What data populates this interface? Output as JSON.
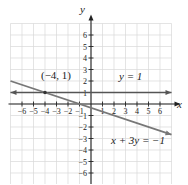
{
  "chart_data": {
    "type": "line",
    "title": "",
    "xlabel": "x",
    "ylabel": "y",
    "xlim": [
      -7,
      7
    ],
    "ylim": [
      -7,
      7
    ],
    "grid": true,
    "x_ticks": [
      "-6",
      "-5",
      "-4",
      "-3",
      "-2",
      "-1",
      "1",
      "2",
      "3",
      "4",
      "5",
      "6"
    ],
    "y_ticks": [
      "6",
      "5",
      "4",
      "3",
      "2",
      "1",
      "-1",
      "-2",
      "-3",
      "-4",
      "-5",
      "-6"
    ],
    "series": [
      {
        "name": "y = 1",
        "equation": "y = 1",
        "x": [
          -7,
          7
        ],
        "y": [
          1,
          1
        ],
        "color": "#555555"
      },
      {
        "name": "x + 3y = -1",
        "equation": "x + 3y = -1",
        "x": [
          -7,
          7
        ],
        "y": [
          2,
          -2.667
        ],
        "color": "#777777"
      }
    ],
    "annotations": [
      {
        "text": "(-4, 1)",
        "x": -4,
        "y": 1,
        "type": "intersection-point"
      },
      {
        "text": "y = 1",
        "near": "line y=1"
      },
      {
        "text": "x + 3y = -1",
        "near": "line x+3y=-1"
      }
    ]
  },
  "labels": {
    "x_axis": "x",
    "y_axis": "y",
    "point": "(−4, 1)",
    "line1": "y = 1",
    "line2": "x + 3y = −1"
  }
}
